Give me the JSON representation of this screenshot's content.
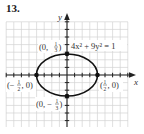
{
  "problem": {
    "number": "13."
  },
  "chart_data": {
    "type": "line",
    "title": "",
    "equation": "4x² + 9y² = 1",
    "curve": "ellipse",
    "semi_axis_x": 0.5,
    "semi_axis_y": 0.3333,
    "xlabel": "x",
    "ylabel": "y",
    "grid": true,
    "grid_step": 0.125,
    "xlim": [
      -1.0,
      1.0
    ],
    "ylim": [
      -0.875,
      0.875
    ],
    "points": [
      {
        "x": 0,
        "y": 0.3333,
        "label": "(0, 1/3)"
      },
      {
        "x": 0,
        "y": -0.3333,
        "label": "(0, −1/3)"
      },
      {
        "x": -0.5,
        "y": 0,
        "label": "(−1/2, 0)"
      },
      {
        "x": 0.5,
        "y": 0,
        "label": "(1/2, 0)"
      }
    ]
  },
  "labels": {
    "axis_x": "x",
    "axis_y": "y",
    "equation": "4x² + 9y² = 1",
    "top_point": {
      "open": "(0, ",
      "num": "1",
      "den": "3",
      "close": ")"
    },
    "bottom_point": {
      "open": "(0, −",
      "num": "1",
      "den": "3",
      "close": ")"
    },
    "left_point": {
      "open": "(−",
      "num": "1",
      "den": "2",
      "close": ", 0)"
    },
    "right_point": {
      "open": "(",
      "num": "1",
      "den": "2",
      "close": ", 0)"
    }
  },
  "colors": {
    "grid": "#cfcfcf",
    "axis": "#222222",
    "curve": "#111111",
    "point": "#111111"
  }
}
